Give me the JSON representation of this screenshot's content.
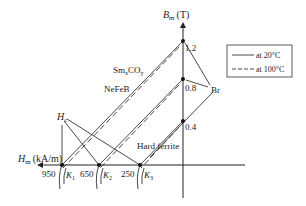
{
  "diagram": {
    "type": "demagnetization-curves",
    "y_axis": {
      "symbol": "B",
      "subscript": "m",
      "unit": "(T)"
    },
    "x_axis": {
      "symbol": "H",
      "subscript": "m",
      "unit": "(kA/m)"
    },
    "y_ticks": [
      "1.2",
      "0.8",
      "0.4"
    ],
    "x_ticks": [
      "950",
      "650",
      "250"
    ],
    "knee_points": [
      {
        "symbol": "K",
        "subscript": "1"
      },
      {
        "symbol": "K",
        "subscript": "2"
      },
      {
        "symbol": "K",
        "subscript": "3"
      }
    ],
    "materials": {
      "smco": {
        "base": "Sm",
        "sub1": "x",
        "mid": "CO",
        "sub2": "y"
      },
      "nefeb": "NeFeB",
      "ferrite": "Hard ferrite"
    },
    "annotations": {
      "br": "Br",
      "hc_symbol": "H",
      "hc_subscript": "c"
    },
    "legend": {
      "solid": "at 20°C",
      "dashed": "at 100°C"
    }
  }
}
